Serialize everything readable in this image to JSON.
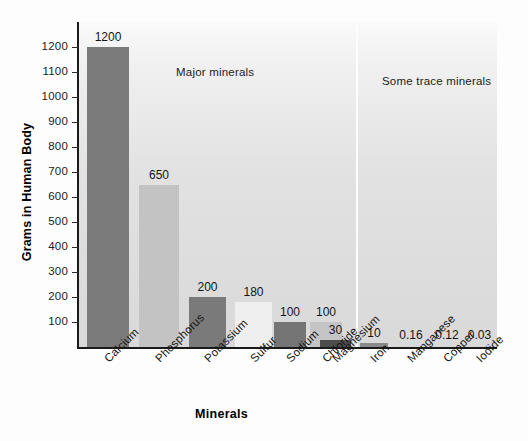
{
  "chart_data": {
    "type": "bar",
    "title": "",
    "xlabel": "Minerals",
    "ylabel": "Grams in Human Body",
    "ylim": [
      0,
      1250
    ],
    "grid": false,
    "legend_position": "none",
    "y_ticks": [
      100,
      200,
      300,
      400,
      500,
      600,
      700,
      800,
      900,
      1000,
      1100,
      1200
    ],
    "y_tick_labels": [
      "100",
      "200",
      "300",
      "400",
      "500",
      "600",
      "700",
      "800",
      "900",
      "1000",
      "1100",
      "1200"
    ],
    "categories": [
      "Calcium",
      "Phosphorus",
      "Potassium",
      "Sulfur",
      "Sodium",
      "Chloride",
      "Magnesium",
      "Iron",
      "Manganese",
      "Copper",
      "Iodide"
    ],
    "values": [
      1200,
      650,
      200,
      180,
      100,
      100,
      30,
      10,
      0.16,
      0.12,
      0.03
    ],
    "value_labels": [
      "1200",
      "650",
      "200",
      "180",
      "100",
      "100",
      "30",
      "10",
      "0.16",
      "0.12",
      "0.03"
    ],
    "annotations": [
      {
        "text": "Major minerals",
        "group": "major"
      },
      {
        "text": "Some trace minerals",
        "group": "trace"
      }
    ],
    "groups": [
      {
        "name": "Major minerals",
        "categories": [
          "Calcium",
          "Phosphorus",
          "Potassium",
          "Sulfur",
          "Sodium",
          "Chloride",
          "Magnesium"
        ]
      },
      {
        "name": "Some trace minerals",
        "categories": [
          "Iron",
          "Manganese",
          "Copper",
          "Iodide"
        ]
      }
    ],
    "bar_colors": [
      "#7b7b7b",
      "#c3c3c3",
      "#7a7a7a",
      "#efefef",
      "#757575",
      "#c5c5c5",
      "#4d4d4d",
      "#8a8a8a",
      "#d9d9d9",
      "#d9d9d9",
      "#d9d9d9"
    ]
  },
  "colors": {
    "panel_top": "#fafafa",
    "panel_bottom": "#d9d9d9",
    "axis": "#1a1a1a",
    "text": "#141414",
    "bar_dark": "#7b7b7b",
    "bar_light": "#c3c3c3",
    "bar_pale": "#efefef",
    "bar_darkest": "#4d4d4d"
  }
}
